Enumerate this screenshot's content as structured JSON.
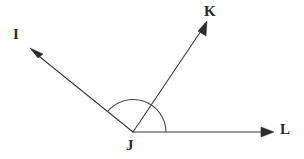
{
  "figure": {
    "background_color": "#ffffff",
    "line_color": "#3a3a3a",
    "label_color": "#2b2b2b",
    "arc_color": "#4a4a4a"
  },
  "vertex": {
    "name": "J",
    "label": "J",
    "x": 133,
    "y": 132,
    "label_x": 126,
    "label_y": 138
  },
  "rays": [
    {
      "name": "ray-JI",
      "label": "I",
      "from_x": 133,
      "from_y": 132,
      "to_x": 33,
      "to_y": 51,
      "arrow_tip_x": 30,
      "arrow_tip_y": 48,
      "label_x": 13,
      "label_y": 27
    },
    {
      "name": "ray-JK",
      "label": "K",
      "from_x": 133,
      "from_y": 132,
      "to_x": 204,
      "to_y": 26,
      "arrow_tip_x": 207,
      "arrow_tip_y": 21,
      "label_x": 204,
      "label_y": 4
    },
    {
      "name": "ray-JL",
      "label": "L",
      "from_x": 133,
      "from_y": 132,
      "to_x": 269,
      "to_y": 132,
      "arrow_tip_x": 274,
      "arrow_tip_y": 132,
      "label_x": 280,
      "label_y": 122
    }
  ],
  "arc": {
    "name": "angle-arc-IJL",
    "center_x": 133,
    "center_y": 132,
    "radius": 33,
    "start_x": 107,
    "start_y": 111,
    "end_x": 166,
    "end_y": 132
  }
}
